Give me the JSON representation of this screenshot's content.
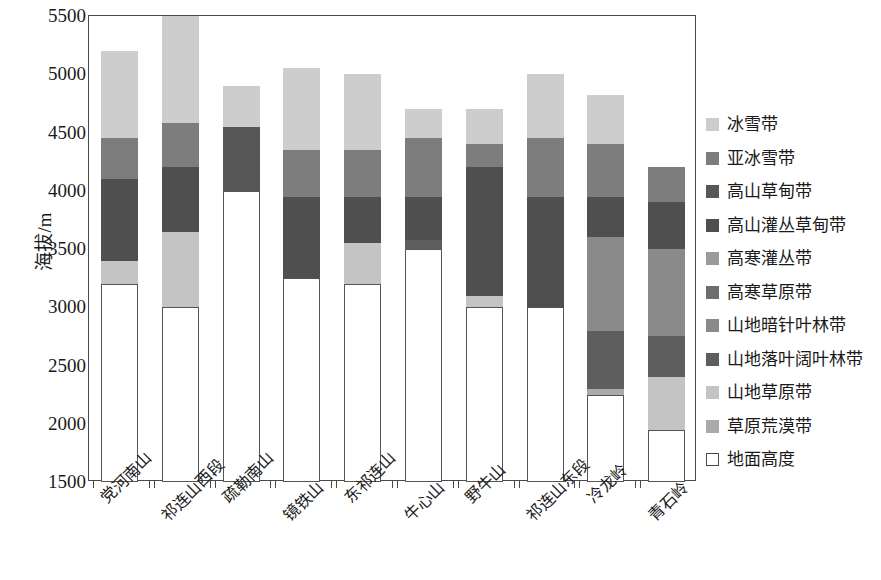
{
  "chart_data": {
    "type": "bar",
    "title": "",
    "subtitle": "",
    "xlabel": "",
    "ylabel": "海拔/m",
    "ylim": [
      1500,
      5500
    ],
    "ytick_values": [
      1500,
      2000,
      2500,
      3000,
      3500,
      4000,
      4500,
      5000,
      5500
    ],
    "ytick_labels": [
      "1500",
      "2000",
      "2500",
      "3000",
      "3500",
      "4000",
      "4500",
      "5000",
      "5500"
    ],
    "grid": false,
    "stacked": true,
    "legend_position": "right",
    "note": "Stacked bars of vertical vegetation belts by elevation for mountains of the Qilian range. Each series value is the top elevation (m) of that belt in the stack; blank means the belt is absent on that mountain.",
    "categories": [
      "党河南山",
      "祁连山西段",
      "疏勒南山",
      "镜铁山",
      "东祁连山",
      "牛心山",
      "野牛山",
      "祁连山东段",
      "冷龙岭",
      "青石岭"
    ],
    "legend_entries": [
      "冰雪带",
      "亚冰雪带",
      "高山草甸带",
      "高山灌丛草甸带",
      "高寒灌丛带",
      "高寒草原带",
      "山地暗针叶林带",
      "山地落叶阔叶林带",
      "山地草原带",
      "草原荒漠带",
      "地面高度"
    ],
    "legend_colors": [
      "#cdcdcd",
      "#7d7d7d",
      "#575757",
      "#4f4f4f",
      "#9a9a9a",
      "#6e6e6e",
      "#8a8a8a",
      "#5e5e5e",
      "#c4c4c4",
      "#aaaaaa",
      "#ffffff"
    ],
    "series": [
      {
        "name": "地面高度",
        "color": "#ffffff",
        "tops": [
          3200,
          3000,
          4000,
          3250,
          3200,
          3500,
          3000,
          3000,
          2250,
          1950
        ]
      },
      {
        "name": "草原荒漠带",
        "color": "#aaaaaa",
        "tops": [
          null,
          null,
          null,
          null,
          null,
          null,
          null,
          null,
          2300,
          null
        ]
      },
      {
        "name": "山地草原带",
        "color": "#c4c4c4",
        "tops": [
          3400,
          3650,
          null,
          null,
          3550,
          null,
          3100,
          null,
          null,
          2400
        ]
      },
      {
        "name": "山地落叶阔叶林带",
        "color": "#5e5e5e",
        "tops": [
          null,
          null,
          null,
          null,
          null,
          3580,
          null,
          null,
          2800,
          2750
        ]
      },
      {
        "name": "山地暗针叶林带",
        "color": "#8a8a8a",
        "tops": [
          null,
          null,
          null,
          null,
          null,
          null,
          null,
          null,
          3600,
          3500
        ]
      },
      {
        "name": "高寒草原带",
        "color": "#6e6e6e",
        "tops": [
          null,
          null,
          null,
          null,
          null,
          null,
          null,
          null,
          null,
          null
        ]
      },
      {
        "name": "高寒灌丛带",
        "color": "#9a9a9a",
        "tops": [
          null,
          null,
          null,
          null,
          null,
          null,
          null,
          null,
          null,
          null
        ]
      },
      {
        "name": "高山灌丛草甸带",
        "color": "#4f4f4f",
        "tops": [
          4100,
          4200,
          null,
          3950,
          3950,
          3950,
          4200,
          3950,
          3950,
          3900
        ]
      },
      {
        "name": "高山草甸带",
        "color": "#575757",
        "tops": [
          null,
          null,
          4550,
          null,
          null,
          null,
          null,
          null,
          null,
          null
        ]
      },
      {
        "name": "亚冰雪带",
        "color": "#7d7d7d",
        "tops": [
          4450,
          4580,
          null,
          4350,
          4350,
          4450,
          4400,
          4450,
          4400,
          4200
        ]
      },
      {
        "name": "冰雪带",
        "color": "#cdcdcd",
        "tops": [
          5200,
          5500,
          4900,
          5050,
          5000,
          4700,
          4700,
          5000,
          4820,
          null
        ]
      }
    ],
    "bar_tops": [
      5200,
      5500,
      4900,
      5050,
      5000,
      4700,
      4700,
      5000,
      4820,
      4200
    ],
    "bars": [
      {
        "category": "党河南山",
        "segments": [
          {
            "belt": "地面高度",
            "from": 1500,
            "to": 3200,
            "color": "#ffffff"
          },
          {
            "belt": "山地草原带",
            "from": 3200,
            "to": 3400,
            "color": "#c4c4c4"
          },
          {
            "belt": "高山灌丛草甸带",
            "from": 3400,
            "to": 4100,
            "color": "#4f4f4f"
          },
          {
            "belt": "亚冰雪带",
            "from": 4100,
            "to": 4450,
            "color": "#7d7d7d"
          },
          {
            "belt": "冰雪带",
            "from": 4450,
            "to": 5200,
            "color": "#cdcdcd"
          }
        ]
      },
      {
        "category": "祁连山西段",
        "segments": [
          {
            "belt": "地面高度",
            "from": 1500,
            "to": 3000,
            "color": "#ffffff"
          },
          {
            "belt": "山地草原带",
            "from": 3000,
            "to": 3650,
            "color": "#c4c4c4"
          },
          {
            "belt": "高山灌丛草甸带",
            "from": 3650,
            "to": 4200,
            "color": "#4f4f4f"
          },
          {
            "belt": "亚冰雪带",
            "from": 4200,
            "to": 4580,
            "color": "#7d7d7d"
          },
          {
            "belt": "冰雪带",
            "from": 4580,
            "to": 5500,
            "color": "#cdcdcd"
          }
        ]
      },
      {
        "category": "疏勒南山",
        "segments": [
          {
            "belt": "地面高度",
            "from": 1500,
            "to": 4000,
            "color": "#ffffff"
          },
          {
            "belt": "高山草甸带",
            "from": 4000,
            "to": 4550,
            "color": "#575757"
          },
          {
            "belt": "冰雪带",
            "from": 4550,
            "to": 4900,
            "color": "#cdcdcd"
          }
        ]
      },
      {
        "category": "镜铁山",
        "segments": [
          {
            "belt": "地面高度",
            "from": 1500,
            "to": 3250,
            "color": "#ffffff"
          },
          {
            "belt": "高山灌丛草甸带",
            "from": 3250,
            "to": 3950,
            "color": "#4f4f4f"
          },
          {
            "belt": "亚冰雪带",
            "from": 3950,
            "to": 4350,
            "color": "#7d7d7d"
          },
          {
            "belt": "冰雪带",
            "from": 4350,
            "to": 5050,
            "color": "#cdcdcd"
          }
        ]
      },
      {
        "category": "东祁连山",
        "segments": [
          {
            "belt": "地面高度",
            "from": 1500,
            "to": 3200,
            "color": "#ffffff"
          },
          {
            "belt": "山地草原带",
            "from": 3200,
            "to": 3550,
            "color": "#c4c4c4"
          },
          {
            "belt": "高山灌丛草甸带",
            "from": 3550,
            "to": 3950,
            "color": "#4f4f4f"
          },
          {
            "belt": "亚冰雪带",
            "from": 3950,
            "to": 4350,
            "color": "#7d7d7d"
          },
          {
            "belt": "冰雪带",
            "from": 4350,
            "to": 5000,
            "color": "#cdcdcd"
          }
        ]
      },
      {
        "category": "牛心山",
        "segments": [
          {
            "belt": "地面高度",
            "from": 1500,
            "to": 3500,
            "color": "#ffffff"
          },
          {
            "belt": "山地落叶阔叶林带",
            "from": 3500,
            "to": 3580,
            "color": "#5e5e5e"
          },
          {
            "belt": "高山灌丛草甸带",
            "from": 3580,
            "to": 3950,
            "color": "#4f4f4f"
          },
          {
            "belt": "亚冰雪带",
            "from": 3950,
            "to": 4450,
            "color": "#7d7d7d"
          },
          {
            "belt": "冰雪带",
            "from": 4450,
            "to": 4700,
            "color": "#cdcdcd"
          }
        ]
      },
      {
        "category": "野牛山",
        "segments": [
          {
            "belt": "地面高度",
            "from": 1500,
            "to": 3000,
            "color": "#ffffff"
          },
          {
            "belt": "山地草原带",
            "from": 3000,
            "to": 3100,
            "color": "#c4c4c4"
          },
          {
            "belt": "高山灌丛草甸带",
            "from": 3100,
            "to": 4200,
            "color": "#4f4f4f"
          },
          {
            "belt": "亚冰雪带",
            "from": 4200,
            "to": 4400,
            "color": "#7d7d7d"
          },
          {
            "belt": "冰雪带",
            "from": 4400,
            "to": 4700,
            "color": "#cdcdcd"
          }
        ]
      },
      {
        "category": "祁连山东段",
        "segments": [
          {
            "belt": "地面高度",
            "from": 1500,
            "to": 3000,
            "color": "#ffffff"
          },
          {
            "belt": "高山灌丛草甸带",
            "from": 3000,
            "to": 3950,
            "color": "#4f4f4f"
          },
          {
            "belt": "亚冰雪带",
            "from": 3950,
            "to": 4450,
            "color": "#7d7d7d"
          },
          {
            "belt": "冰雪带",
            "from": 4450,
            "to": 5000,
            "color": "#cdcdcd"
          }
        ]
      },
      {
        "category": "冷龙岭",
        "segments": [
          {
            "belt": "地面高度",
            "from": 1500,
            "to": 2250,
            "color": "#ffffff"
          },
          {
            "belt": "草原荒漠带",
            "from": 2250,
            "to": 2300,
            "color": "#aaaaaa"
          },
          {
            "belt": "山地落叶阔叶林带",
            "from": 2300,
            "to": 2800,
            "color": "#5e5e5e"
          },
          {
            "belt": "山地暗针叶林带",
            "from": 2800,
            "to": 3600,
            "color": "#8a8a8a"
          },
          {
            "belt": "高山灌丛草甸带",
            "from": 3600,
            "to": 3950,
            "color": "#4f4f4f"
          },
          {
            "belt": "亚冰雪带",
            "from": 3950,
            "to": 4400,
            "color": "#7d7d7d"
          },
          {
            "belt": "冰雪带",
            "from": 4400,
            "to": 4820,
            "color": "#cdcdcd"
          }
        ]
      },
      {
        "category": "青石岭",
        "segments": [
          {
            "belt": "地面高度",
            "from": 1500,
            "to": 1950,
            "color": "#ffffff"
          },
          {
            "belt": "山地草原带",
            "from": 1950,
            "to": 2400,
            "color": "#c4c4c4"
          },
          {
            "belt": "山地落叶阔叶林带",
            "from": 2400,
            "to": 2750,
            "color": "#5e5e5e"
          },
          {
            "belt": "山地暗针叶林带",
            "from": 2750,
            "to": 3500,
            "color": "#8a8a8a"
          },
          {
            "belt": "高山灌丛草甸带",
            "from": 3500,
            "to": 3900,
            "color": "#4f4f4f"
          },
          {
            "belt": "亚冰雪带",
            "from": 3900,
            "to": 4200,
            "color": "#7d7d7d"
          }
        ]
      }
    ]
  }
}
